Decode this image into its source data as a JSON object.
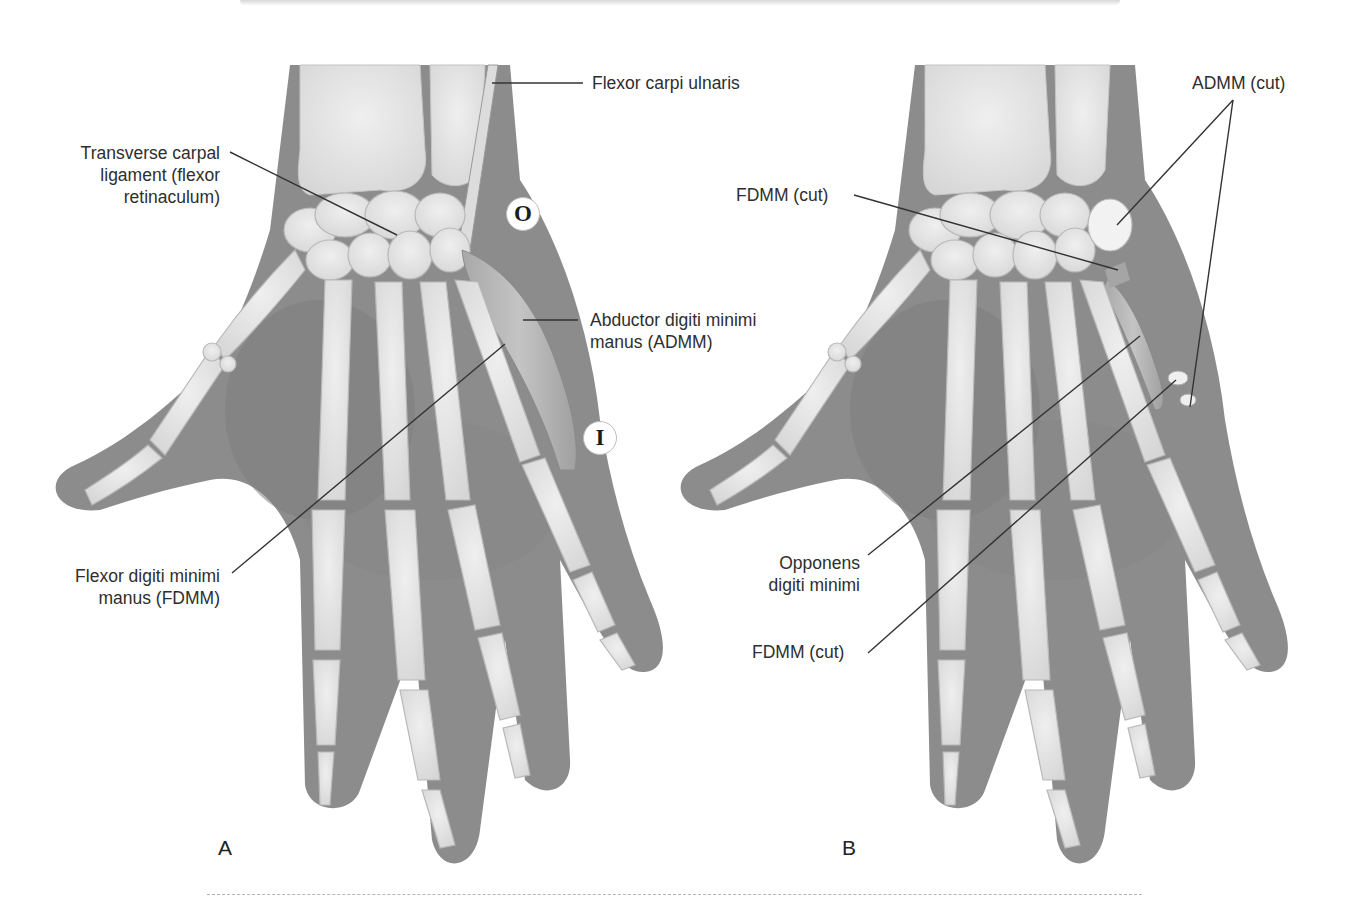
{
  "figure": {
    "panels": [
      {
        "id": "A",
        "letter": "A",
        "labels": {
          "transverse_carpal": [
            "Transverse carpal",
            "ligament (flexor",
            "retinaculum)"
          ],
          "flexor_carpi_ulnaris": "Flexor carpi ulnaris",
          "abductor": [
            "Abductor digiti minimi",
            "manus (ADMM)"
          ],
          "flexor_digiti": [
            "Flexor digiti minimi",
            "manus (FDMM)"
          ]
        },
        "markers": {
          "origin": "O",
          "insertion": "I"
        }
      },
      {
        "id": "B",
        "letter": "B",
        "labels": {
          "admm_cut": "ADMM (cut)",
          "fdmm_cut_top": "FDMM (cut)",
          "opponens": [
            "Opponens",
            "digiti minimi"
          ],
          "fdmm_cut_bottom": "FDMM (cut)"
        }
      }
    ],
    "colors": {
      "skin": "#8e8e8e",
      "skin_dark": "#7a7a7a",
      "bone": "#e6e6e6",
      "bone_edge": "#bdbdbd",
      "leader_line": "#333333",
      "divider": "#b5b5b5"
    }
  }
}
